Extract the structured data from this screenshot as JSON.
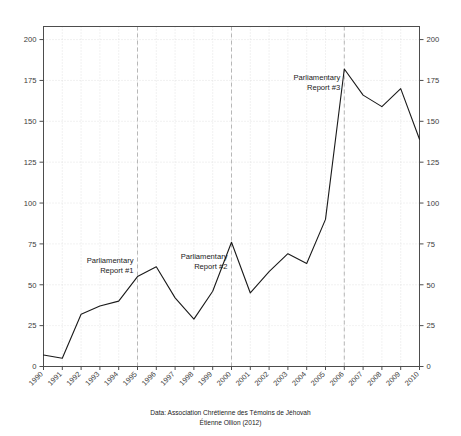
{
  "chart_data": {
    "type": "line",
    "title": "",
    "xlabel": "",
    "ylabel": "",
    "x": [
      1990,
      1991,
      1992,
      1993,
      1994,
      1995,
      1996,
      1997,
      1998,
      1999,
      2000,
      2001,
      2002,
      2003,
      2004,
      2005,
      2006,
      2007,
      2008,
      2009,
      2010
    ],
    "categories": [
      "1990",
      "1991",
      "1992",
      "1993",
      "1994",
      "1995",
      "1996",
      "1997",
      "1998",
      "1999",
      "2000",
      "2001",
      "2002",
      "2003",
      "2004",
      "2005",
      "2006",
      "2007",
      "2008",
      "2009",
      "2010"
    ],
    "values": [
      7,
      5,
      32,
      37,
      40,
      55,
      61,
      42,
      29,
      46,
      76,
      45,
      58,
      69,
      63,
      90,
      182,
      166,
      159,
      170,
      139
    ],
    "series": [
      {
        "name": "",
        "values": [
          7,
          5,
          32,
          37,
          40,
          55,
          61,
          42,
          29,
          46,
          76,
          45,
          58,
          69,
          63,
          90,
          182,
          166,
          159,
          170,
          139
        ]
      }
    ],
    "xlim": [
      1990,
      2010
    ],
    "ylim": [
      0,
      208
    ],
    "ytick_values": [
      0,
      25,
      50,
      75,
      100,
      125,
      150,
      175,
      200
    ],
    "ytick_labels": [
      "0",
      "25",
      "50",
      "75",
      "100",
      "125",
      "150",
      "175",
      "200"
    ],
    "ytick_labels_right": [
      "0",
      "25",
      "50",
      "75",
      "100",
      "125",
      "150",
      "175",
      "200"
    ],
    "xtick_labels": [
      "1990",
      "1991",
      "1992",
      "1993",
      "1994",
      "1995",
      "1996",
      "1997",
      "1998",
      "1999",
      "2000",
      "2001",
      "2002",
      "2003",
      "2004",
      "2005",
      "2006",
      "2007",
      "2008",
      "2009",
      "2010"
    ],
    "xtick_rotation_degrees": 45,
    "grid": true,
    "grid_style": "dotted-light",
    "legend": null,
    "legend_position": "none",
    "line_color": "#1a1a1a",
    "grid_color": "#d9d9d9",
    "vline_color": "#b0b0b0",
    "axis_color": "#4d4d4d",
    "annotations": [
      {
        "id": "report-1",
        "line1": "Parliamentary",
        "line2": "Report #1",
        "at_year": 1995,
        "align": "right"
      },
      {
        "id": "report-2",
        "line1": "Parliamentary",
        "line2": "Report #2",
        "at_year": 2000,
        "align": "right"
      },
      {
        "id": "report-3",
        "line1": "Parliamentary",
        "line2": "Report #3",
        "at_year": 2006,
        "align": "right"
      }
    ],
    "vertical_markers": [
      1995,
      2000,
      2006
    ]
  },
  "caption": {
    "line1": "Data: Association Chrétienne des Témoins de Jéhovah",
    "line2": "Étienne Ollion (2012)"
  },
  "title": {
    "clipped_text": ""
  }
}
